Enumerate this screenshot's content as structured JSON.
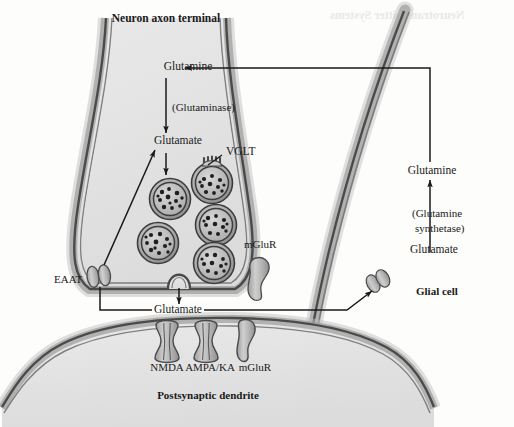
{
  "figure": {
    "type": "diagram",
    "background_color": "#fdfdfb",
    "ink_color": "#1a1a1a",
    "cell_fill": "#e2e2e2",
    "membrane_color": "#555555",
    "protein_fill": "#b8b8b8"
  },
  "labels": {
    "axon_terminal": "Neuron axon terminal",
    "glutamine_pre": "Glutamine",
    "glutaminase": "(Glutaminase)",
    "glutamate_pre": "Glutamate",
    "vglt": "VGLT",
    "mglur_pre": "mGluR",
    "eaat": "EAAT",
    "glutamate_cleft": "Glutamate",
    "nmda": "NMDA",
    "ampa_ka": "AMPA/KA",
    "mglur_post": "mGluR",
    "postsynaptic_dendrite": "Postsynaptic dendrite",
    "glutamine_glia": "Glutamine",
    "glutamine_synthetase": "(Glutamine",
    "glutamine_synthetase2": "synthetase)",
    "glutamate_glia": "Glutamate",
    "glial_cell": "Glial cell"
  },
  "structures": {
    "vesicle_count": 5,
    "presynaptic_receptors": [
      "VGLT",
      "mGluR",
      "EAAT"
    ],
    "postsynaptic_receptors": [
      "NMDA",
      "AMPA/KA",
      "mGluR"
    ],
    "glial_transporter": "EAAT"
  },
  "flow_steps": [
    "Glutamine enters axon terminal",
    "Glutaminase converts glutamine to glutamate",
    "Glutamate loaded into vesicles by VGLT",
    "Vesicle fusion releases glutamate into cleft",
    "Glutamate binds NMDA, AMPA/KA, mGluR receptors",
    "EAAT reuptake into terminal and glial cell",
    "Glutamine synthetase converts glutamate to glutamine in glia",
    "Glutamine returns to axon terminal"
  ],
  "artifact_text": {
    "note": "faint mirrored show-through text at top right",
    "line": "Neurotransmitter Systems"
  }
}
